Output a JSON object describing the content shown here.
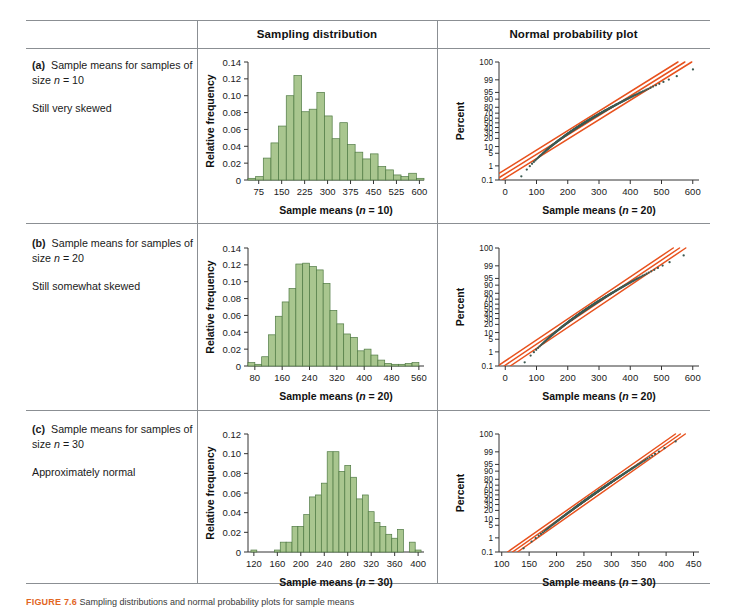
{
  "figure": {
    "caption_number": "FIGURE 7.6",
    "caption_text": "Sampling distributions and normal probability plots for sample means"
  },
  "table": {
    "headers": {
      "col1": "",
      "col2": "Sampling distribution",
      "col3": "Normal probability plot"
    },
    "rows": [
      {
        "id": "a",
        "marker": "(a)",
        "line1": "Sample means for samples of size n = 10",
        "line2": "Still very skewed"
      },
      {
        "id": "b",
        "marker": "(b)",
        "line1": "Sample means for samples of size n = 20",
        "line2": "Still somewhat skewed"
      },
      {
        "id": "c",
        "marker": "(c)",
        "line1": "Sample means for samples of size n = 30",
        "line2": "Approximately normal"
      }
    ]
  },
  "colors": {
    "bar_fill": "#a9c68f",
    "bar_stroke": "#4f7a43",
    "line_orange": "#e8521e",
    "point_dark": "#3c5a52",
    "rule": "#8b8f93",
    "caption_accent": "#e2661f"
  },
  "chart_data": [
    {
      "type": "bar",
      "name": "sampling-distribution-n10",
      "title": "Sampling distribution",
      "xlabel": "Sample means (n = 10)",
      "ylabel": "Relative frequency",
      "xlim": [
        40,
        615
      ],
      "ylim": [
        0,
        0.14
      ],
      "xticks": [
        75,
        150,
        225,
        300,
        375,
        450,
        525,
        600
      ],
      "yticks": [
        0,
        0.02,
        0.04,
        0.06,
        0.08,
        0.1,
        0.12,
        0.14
      ],
      "ytick_labels": [
        "0",
        "0.02",
        "0.04",
        "0.06",
        "0.08",
        "0.10",
        "0.12",
        "0.14"
      ],
      "bin_width": 25,
      "bin_starts": [
        40,
        65,
        90,
        115,
        140,
        165,
        190,
        215,
        240,
        265,
        290,
        315,
        340,
        365,
        390,
        415,
        440,
        465,
        490,
        515,
        540,
        565,
        590
      ],
      "values": [
        0.002,
        0.004,
        0.026,
        0.044,
        0.064,
        0.1,
        0.124,
        0.081,
        0.084,
        0.104,
        0.076,
        0.049,
        0.068,
        0.042,
        0.033,
        0.025,
        0.031,
        0.016,
        0.012,
        0.006,
        0.004,
        0.008,
        0.002
      ],
      "grid": false,
      "legend": "none"
    },
    {
      "type": "scatter",
      "name": "normal-probability-plot-a",
      "title": "Normal probability plot",
      "xlabel": "Sample means (n = 20)",
      "ylabel": "Percent",
      "xlim": [
        -20,
        620
      ],
      "xticks": [
        0,
        100,
        200,
        300,
        400,
        500,
        600
      ],
      "percent_ticks": [
        0.1,
        1,
        5,
        10,
        20,
        30,
        40,
        50,
        60,
        70,
        80,
        90,
        95,
        99,
        100
      ],
      "percent_tick_labels": [
        "0.1",
        "1",
        "5",
        "10",
        "20",
        "30",
        "40",
        "50",
        "60",
        "70",
        "80",
        "90",
        "95",
        "99",
        "100"
      ],
      "fit_lines": 3,
      "grid": false,
      "legend": "none"
    },
    {
      "type": "bar",
      "name": "sampling-distribution-n20",
      "title": "Sampling distribution",
      "xlabel": "Sample means (n = 20)",
      "ylabel": "Relative frequency",
      "xlim": [
        60,
        575
      ],
      "ylim": [
        0,
        0.14
      ],
      "xticks": [
        80,
        160,
        240,
        320,
        400,
        480,
        560
      ],
      "ytick_labels": [
        "0",
        "0.02",
        "0.04",
        "0.06",
        "0.08",
        "0.10",
        "0.12",
        "0.14"
      ],
      "bin_width": 20,
      "bin_starts": [
        60,
        80,
        100,
        120,
        140,
        160,
        180,
        200,
        220,
        240,
        260,
        280,
        300,
        320,
        340,
        360,
        380,
        400,
        420,
        440,
        460,
        480,
        500,
        520,
        540
      ],
      "values": [
        0.004,
        0.002,
        0.011,
        0.037,
        0.059,
        0.076,
        0.092,
        0.121,
        0.122,
        0.118,
        0.114,
        0.098,
        0.066,
        0.05,
        0.038,
        0.034,
        0.018,
        0.02,
        0.013,
        0.007,
        0.003,
        0.002,
        0.002,
        0.003,
        0.004
      ],
      "grid": false,
      "legend": "none"
    },
    {
      "type": "scatter",
      "name": "normal-probability-plot-b",
      "title": "Normal probability plot",
      "xlabel": "Sample means (n = 20)",
      "ylabel": "Percent",
      "xlim": [
        -20,
        620
      ],
      "xticks": [
        0,
        100,
        200,
        300,
        400,
        500,
        600
      ],
      "percent_tick_labels": [
        "0.1",
        "1",
        "5",
        "10",
        "20",
        "30",
        "40",
        "50",
        "60",
        "70",
        "80",
        "90",
        "95",
        "99",
        "100"
      ],
      "fit_lines": 3,
      "grid": false,
      "legend": "none"
    },
    {
      "type": "bar",
      "name": "sampling-distribution-n30",
      "title": "Sampling distribution",
      "xlabel": "Sample means (n = 30)",
      "ylabel": "Relative frequency",
      "xlim": [
        110,
        410
      ],
      "ylim": [
        0,
        0.12
      ],
      "xticks": [
        120,
        160,
        200,
        240,
        280,
        320,
        360,
        400
      ],
      "ytick_labels": [
        "0",
        "0.02",
        "0.04",
        "0.06",
        "0.08",
        "0.10",
        "0.12"
      ],
      "bin_width": 10,
      "bin_starts": [
        115,
        125,
        135,
        145,
        155,
        165,
        175,
        185,
        195,
        205,
        215,
        225,
        235,
        245,
        255,
        265,
        275,
        285,
        295,
        305,
        315,
        325,
        335,
        345,
        355,
        365,
        375,
        385,
        395
      ],
      "values": [
        0.002,
        0.0,
        0.0,
        0.0,
        0.002,
        0.01,
        0.01,
        0.026,
        0.026,
        0.038,
        0.056,
        0.058,
        0.07,
        0.102,
        0.102,
        0.082,
        0.088,
        0.076,
        0.054,
        0.058,
        0.041,
        0.03,
        0.026,
        0.018,
        0.014,
        0.023,
        0.0,
        0.01,
        0.002
      ],
      "grid": false,
      "legend": "none"
    },
    {
      "type": "scatter",
      "name": "normal-probability-plot-c",
      "title": "Normal probability plot",
      "xlabel": "Sample means (n = 30)",
      "ylabel": "Percent",
      "xlim": [
        95,
        460
      ],
      "xticks": [
        100,
        150,
        200,
        250,
        300,
        350,
        400,
        450
      ],
      "percent_tick_labels": [
        "0.1",
        "1",
        "5",
        "10",
        "20",
        "30",
        "40",
        "50",
        "60",
        "70",
        "80",
        "90",
        "95",
        "99",
        "100"
      ],
      "fit_lines": 3,
      "grid": false,
      "legend": "none"
    }
  ]
}
